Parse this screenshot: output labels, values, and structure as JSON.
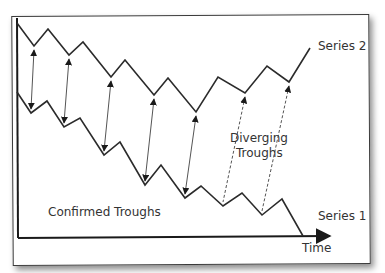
{
  "chart_data": {
    "type": "line",
    "title": "",
    "xlabel": "Time",
    "ylabel": "",
    "grid": false,
    "legend_position": "inline-right",
    "series": [
      {
        "name": "Series 2",
        "points": [
          [
            17,
            23
          ],
          [
            34,
            46
          ],
          [
            48,
            29
          ],
          [
            69,
            55
          ],
          [
            83,
            42
          ],
          [
            111,
            77
          ],
          [
            125,
            60
          ],
          [
            154,
            95
          ],
          [
            168,
            78
          ],
          [
            196,
            112
          ],
          [
            218,
            77
          ],
          [
            245,
            93
          ],
          [
            267,
            66
          ],
          [
            289,
            82
          ],
          [
            310,
            48
          ]
        ]
      },
      {
        "name": "Series 1",
        "points": [
          [
            17,
            92
          ],
          [
            31,
            113
          ],
          [
            47,
            101
          ],
          [
            64,
            127
          ],
          [
            80,
            118
          ],
          [
            104,
            155
          ],
          [
            120,
            142
          ],
          [
            145,
            185
          ],
          [
            161,
            165
          ],
          [
            185,
            198
          ],
          [
            201,
            186
          ],
          [
            223,
            206
          ],
          [
            242,
            193
          ],
          [
            262,
            215
          ],
          [
            282,
            199
          ],
          [
            303,
            236
          ]
        ]
      }
    ],
    "annotations": [
      {
        "text": "Confirmed Troughs",
        "type": "solid-double-arrows",
        "pairs": [
          [
            [
              34,
              46
            ],
            [
              31,
              113
            ]
          ],
          [
            [
              69,
              55
            ],
            [
              64,
              127
            ]
          ],
          [
            [
              111,
              77
            ],
            [
              104,
              155
            ]
          ],
          [
            [
              154,
              95
            ],
            [
              145,
              185
            ]
          ],
          [
            [
              196,
              112
            ],
            [
              185,
              198
            ]
          ]
        ]
      },
      {
        "text": "Diverging Troughs",
        "type": "dashed-arrows",
        "pairs": [
          [
            [
              245,
              93
            ],
            [
              223,
              206
            ]
          ],
          [
            [
              289,
              82
            ],
            [
              262,
              215
            ]
          ]
        ]
      }
    ]
  },
  "labels": {
    "series2": "Series 2",
    "series1": "Series 1",
    "xaxis": "Time",
    "confirmed": "Confirmed Troughs",
    "diverging_line1": "Diverging",
    "diverging_line2": "Troughs"
  },
  "colors": {
    "line": "#2b2b2b",
    "arrow": "#555555",
    "text": "#333333",
    "axis": "#1a1a1a"
  }
}
